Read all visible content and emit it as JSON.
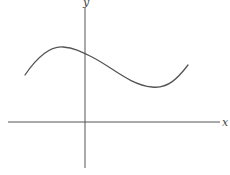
{
  "diagram": {
    "type": "function-graph",
    "axes": {
      "x_label": "x",
      "y_label": "y",
      "color": "#555555"
    },
    "curve": {
      "color": "#555555",
      "description": "smooth cubic-like curve: rises to a local maximum left of the y-axis, decreases through the y-axis to a local minimum right of it, then rises again; entirely above the x-axis",
      "features": [
        {
          "name": "left-end",
          "relative_position": "left of y-axis, above x-axis"
        },
        {
          "name": "local-maximum",
          "relative_position": "left of y-axis"
        },
        {
          "name": "y-intercept",
          "relative_position": "positive y-value"
        },
        {
          "name": "local-minimum",
          "relative_position": "right of y-axis, above x-axis"
        },
        {
          "name": "right-end",
          "relative_position": "right of y-axis, above x-axis"
        }
      ]
    }
  }
}
